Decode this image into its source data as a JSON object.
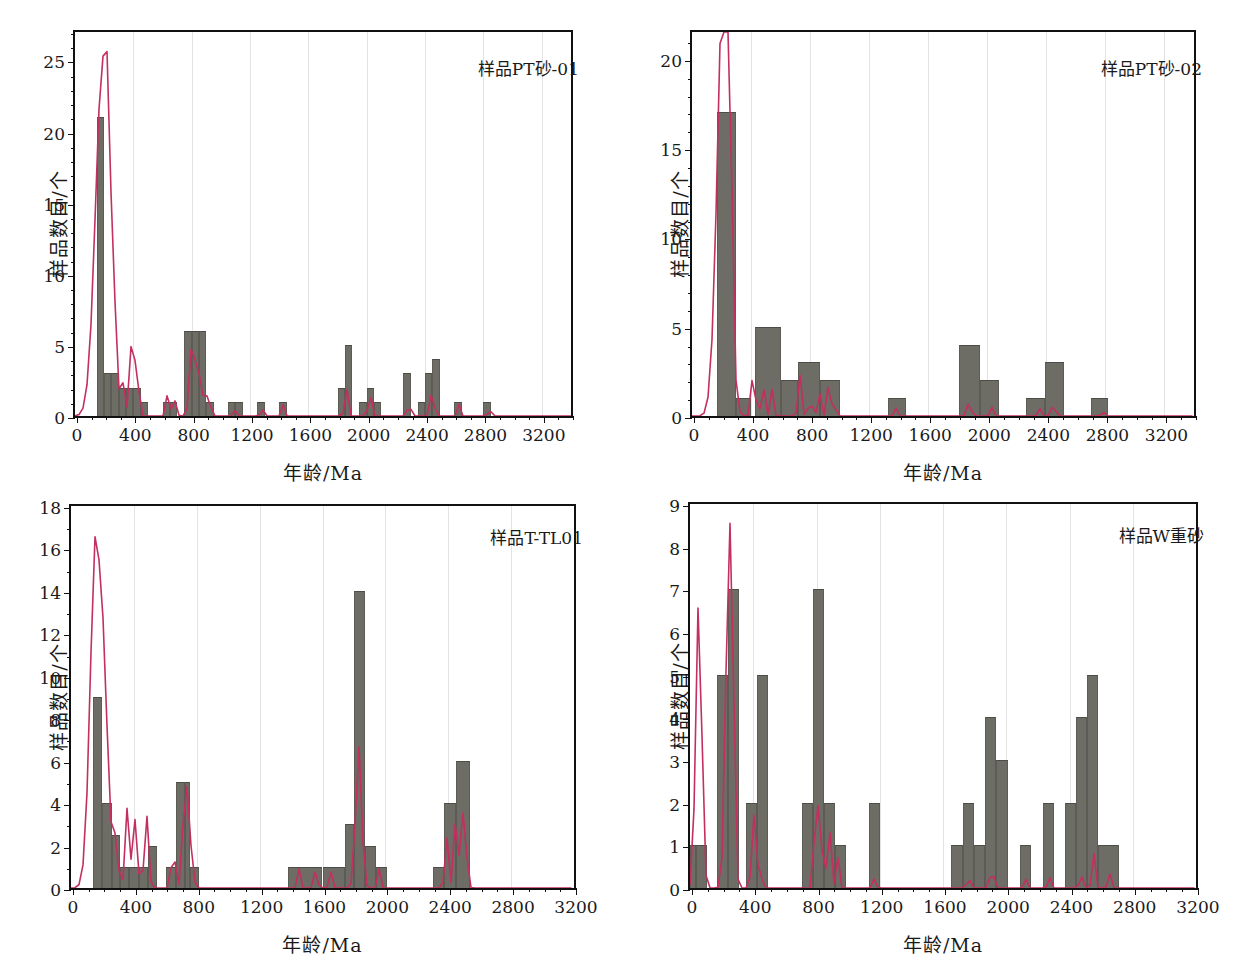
{
  "figure": {
    "panel_count": 4,
    "bar_color": "#6d6d66",
    "curve_color": "#c32f5e",
    "grid_color": "#e3e3e3",
    "axis_color": "#111111"
  },
  "common": {
    "xlabel": "年龄/Ma",
    "ylabel": "样品数目/个",
    "xticks": [
      0,
      400,
      800,
      1200,
      1600,
      2000,
      2400,
      2800,
      3200
    ],
    "xlim": [
      0,
      3400
    ]
  },
  "chart_data": [
    {
      "type": "bar",
      "id": "panel-a",
      "title": "样品PT砂-01",
      "xlabel": "年龄/Ma",
      "ylabel": "样品数目/个",
      "xlim": [
        0,
        3400
      ],
      "ylim": [
        0,
        27
      ],
      "yticks": [
        0,
        5,
        10,
        15,
        20,
        25
      ],
      "ytick_minor_step": 1,
      "grid": "vertical-only",
      "bin_width": 50,
      "bins": [
        {
          "x0": 150,
          "x1": 200,
          "value": 21
        },
        {
          "x0": 200,
          "x1": 250,
          "value": 3
        },
        {
          "x0": 250,
          "x1": 300,
          "value": 3
        },
        {
          "x0": 300,
          "x1": 350,
          "value": 2
        },
        {
          "x0": 350,
          "x1": 400,
          "value": 2
        },
        {
          "x0": 400,
          "x1": 450,
          "value": 2
        },
        {
          "x0": 450,
          "x1": 500,
          "value": 1
        },
        {
          "x0": 600,
          "x1": 650,
          "value": 1
        },
        {
          "x0": 650,
          "x1": 700,
          "value": 1
        },
        {
          "x0": 750,
          "x1": 800,
          "value": 6
        },
        {
          "x0": 800,
          "x1": 850,
          "value": 6
        },
        {
          "x0": 850,
          "x1": 900,
          "value": 6
        },
        {
          "x0": 900,
          "x1": 950,
          "value": 1
        },
        {
          "x0": 1050,
          "x1": 1100,
          "value": 1
        },
        {
          "x0": 1100,
          "x1": 1150,
          "value": 1
        },
        {
          "x0": 1250,
          "x1": 1300,
          "value": 1
        },
        {
          "x0": 1400,
          "x1": 1450,
          "value": 1
        },
        {
          "x0": 1800,
          "x1": 1850,
          "value": 2
        },
        {
          "x0": 1850,
          "x1": 1900,
          "value": 5
        },
        {
          "x0": 1950,
          "x1": 2000,
          "value": 1
        },
        {
          "x0": 2000,
          "x1": 2050,
          "value": 2
        },
        {
          "x0": 2050,
          "x1": 2100,
          "value": 1
        },
        {
          "x0": 2250,
          "x1": 2300,
          "value": 3
        },
        {
          "x0": 2350,
          "x1": 2400,
          "value": 1
        },
        {
          "x0": 2400,
          "x1": 2450,
          "value": 3
        },
        {
          "x0": 2450,
          "x1": 2500,
          "value": 4
        },
        {
          "x0": 2600,
          "x1": 2650,
          "value": 1
        },
        {
          "x0": 2800,
          "x1": 2850,
          "value": 1
        }
      ],
      "kde_peaks": [
        {
          "x": 190,
          "y": 24.7
        },
        {
          "x": 225,
          "y": 5.3
        },
        {
          "x": 265,
          "y": 3.1
        },
        {
          "x": 330,
          "y": 1.9
        },
        {
          "x": 395,
          "y": 6.0
        },
        {
          "x": 435,
          "y": 1.6
        },
        {
          "x": 640,
          "y": 2.1
        },
        {
          "x": 690,
          "y": 1.2
        },
        {
          "x": 800,
          "y": 4.9
        },
        {
          "x": 835,
          "y": 3.6
        },
        {
          "x": 865,
          "y": 2.6
        },
        {
          "x": 915,
          "y": 2.2
        },
        {
          "x": 1090,
          "y": 0.55
        },
        {
          "x": 1280,
          "y": 0.75
        },
        {
          "x": 1430,
          "y": 0.9
        },
        {
          "x": 1860,
          "y": 2.0
        },
        {
          "x": 2020,
          "y": 1.9
        },
        {
          "x": 2290,
          "y": 1.3
        },
        {
          "x": 2450,
          "y": 2.2
        },
        {
          "x": 2630,
          "y": 0.85
        },
        {
          "x": 2840,
          "y": 0.8
        }
      ]
    },
    {
      "type": "bar",
      "id": "panel-b",
      "title": "样品PT砂-02",
      "xlabel": "年龄/Ma",
      "ylabel": "样品数目/个",
      "xlim": [
        0,
        3400
      ],
      "ylim": [
        0,
        21.5
      ],
      "yticks": [
        0,
        5,
        10,
        15,
        20
      ],
      "ytick_minor_step": 1,
      "grid": "vertical-only",
      "bin_width": 100,
      "bins": [
        {
          "x0": 170,
          "x1": 300,
          "value": 17
        },
        {
          "x0": 300,
          "x1": 400,
          "value": 1
        },
        {
          "x0": 430,
          "x1": 600,
          "value": 5
        },
        {
          "x0": 600,
          "x1": 720,
          "value": 2
        },
        {
          "x0": 720,
          "x1": 870,
          "value": 3
        },
        {
          "x0": 870,
          "x1": 1000,
          "value": 2
        },
        {
          "x0": 1330,
          "x1": 1450,
          "value": 1
        },
        {
          "x0": 1810,
          "x1": 1950,
          "value": 4
        },
        {
          "x0": 1950,
          "x1": 2080,
          "value": 2
        },
        {
          "x0": 2260,
          "x1": 2390,
          "value": 1
        },
        {
          "x0": 2390,
          "x1": 2520,
          "value": 3
        },
        {
          "x0": 2700,
          "x1": 2820,
          "value": 1
        }
      ],
      "kde_peaks": [
        {
          "x": 205,
          "y": 19.4
        },
        {
          "x": 232,
          "y": 11.0
        },
        {
          "x": 255,
          "y": 6.2
        },
        {
          "x": 410,
          "y": 2.1
        },
        {
          "x": 445,
          "y": 1.5
        },
        {
          "x": 490,
          "y": 1.5
        },
        {
          "x": 540,
          "y": 1.5
        },
        {
          "x": 730,
          "y": 2.3
        },
        {
          "x": 800,
          "y": 1.4
        },
        {
          "x": 860,
          "y": 1.6
        },
        {
          "x": 920,
          "y": 1.6
        },
        {
          "x": 960,
          "y": 1.4
        },
        {
          "x": 1380,
          "y": 0.45
        },
        {
          "x": 1880,
          "y": 1.3
        },
        {
          "x": 2030,
          "y": 0.5
        },
        {
          "x": 2350,
          "y": 0.6
        },
        {
          "x": 2450,
          "y": 1.15
        },
        {
          "x": 2780,
          "y": 0.45
        }
      ]
    },
    {
      "type": "bar",
      "id": "panel-c",
      "title": "样品T-TL01",
      "xlabel": "年龄/Ma",
      "ylabel": "样品数目/个",
      "xlim": [
        0,
        3200
      ],
      "ylim": [
        0,
        18
      ],
      "yticks": [
        0,
        2,
        4,
        6,
        8,
        10,
        12,
        14,
        16,
        18
      ],
      "ytick_minor_step": 1,
      "grid": "vertical-only",
      "bin_width": 50,
      "bins": [
        {
          "x0": 140,
          "x1": 200,
          "value": 9
        },
        {
          "x0": 200,
          "x1": 260,
          "value": 4
        },
        {
          "x0": 260,
          "x1": 310,
          "value": 2.5
        },
        {
          "x0": 310,
          "x1": 370,
          "value": 1
        },
        {
          "x0": 370,
          "x1": 430,
          "value": 1
        },
        {
          "x0": 430,
          "x1": 490,
          "value": 1
        },
        {
          "x0": 490,
          "x1": 545,
          "value": 2
        },
        {
          "x0": 605,
          "x1": 665,
          "value": 1
        },
        {
          "x0": 665,
          "x1": 725,
          "value": 5
        },
        {
          "x0": 725,
          "x1": 760,
          "value": 5
        },
        {
          "x0": 760,
          "x1": 815,
          "value": 1
        },
        {
          "x0": 1380,
          "x1": 1600,
          "value": 1
        },
        {
          "x0": 1600,
          "x1": 1740,
          "value": 1
        },
        {
          "x0": 1740,
          "x1": 1800,
          "value": 3
        },
        {
          "x0": 1800,
          "x1": 1870,
          "value": 14
        },
        {
          "x0": 1870,
          "x1": 1940,
          "value": 2
        },
        {
          "x0": 1940,
          "x1": 2010,
          "value": 1
        },
        {
          "x0": 2300,
          "x1": 2370,
          "value": 1
        },
        {
          "x0": 2370,
          "x1": 2450,
          "value": 4
        },
        {
          "x0": 2450,
          "x1": 2540,
          "value": 6
        }
      ],
      "kde_peaks": [
        {
          "x": 160,
          "y": 16.9
        },
        {
          "x": 210,
          "y": 5.0
        },
        {
          "x": 235,
          "y": 3.0
        },
        {
          "x": 265,
          "y": 2.6
        },
        {
          "x": 290,
          "y": 2.2
        },
        {
          "x": 360,
          "y": 3.9
        },
        {
          "x": 410,
          "y": 3.3
        },
        {
          "x": 480,
          "y": 3.5
        },
        {
          "x": 650,
          "y": 2.2
        },
        {
          "x": 730,
          "y": 5.4
        },
        {
          "x": 770,
          "y": 1.7
        },
        {
          "x": 1450,
          "y": 0.9
        },
        {
          "x": 1560,
          "y": 1.1
        },
        {
          "x": 1650,
          "y": 0.85
        },
        {
          "x": 1830,
          "y": 6.7
        },
        {
          "x": 1960,
          "y": 0.9
        },
        {
          "x": 2390,
          "y": 2.4
        },
        {
          "x": 2450,
          "y": 3.5
        },
        {
          "x": 2500,
          "y": 3.9
        }
      ]
    },
    {
      "type": "bar",
      "id": "panel-d",
      "title": "样品W重砂",
      "xlabel": "年龄/Ma",
      "ylabel": "样品数目/个",
      "xlim": [
        0,
        3200
      ],
      "ylim": [
        0,
        9
      ],
      "yticks": [
        0,
        1,
        2,
        3,
        4,
        5,
        6,
        7,
        8,
        9
      ],
      "ytick_minor_step": 1,
      "grid": "vertical-only",
      "bin_width": 70,
      "bins": [
        {
          "x0": 0,
          "x1": 40,
          "value": 1
        },
        {
          "x0": 40,
          "x1": 105,
          "value": 1
        },
        {
          "x0": 170,
          "x1": 240,
          "value": 5
        },
        {
          "x0": 240,
          "x1": 310,
          "value": 7
        },
        {
          "x0": 355,
          "x1": 425,
          "value": 2
        },
        {
          "x0": 425,
          "x1": 495,
          "value": 5
        },
        {
          "x0": 710,
          "x1": 780,
          "value": 2
        },
        {
          "x0": 780,
          "x1": 850,
          "value": 7
        },
        {
          "x0": 850,
          "x1": 920,
          "value": 2
        },
        {
          "x0": 920,
          "x1": 985,
          "value": 1
        },
        {
          "x0": 1130,
          "x1": 1200,
          "value": 2
        },
        {
          "x0": 1650,
          "x1": 1725,
          "value": 1
        },
        {
          "x0": 1725,
          "x1": 1795,
          "value": 2
        },
        {
          "x0": 1795,
          "x1": 1865,
          "value": 1
        },
        {
          "x0": 1865,
          "x1": 1935,
          "value": 4
        },
        {
          "x0": 1935,
          "x1": 2010,
          "value": 3
        },
        {
          "x0": 2085,
          "x1": 2155,
          "value": 1
        },
        {
          "x0": 2230,
          "x1": 2300,
          "value": 2
        },
        {
          "x0": 2370,
          "x1": 2440,
          "value": 2
        },
        {
          "x0": 2440,
          "x1": 2510,
          "value": 4
        },
        {
          "x0": 2510,
          "x1": 2580,
          "value": 5
        },
        {
          "x0": 2580,
          "x1": 2710,
          "value": 1
        }
      ],
      "kde_peaks": [
        {
          "x": 55,
          "y": 6.75
        },
        {
          "x": 245,
          "y": 7.45
        },
        {
          "x": 262,
          "y": 2.3
        },
        {
          "x": 280,
          "y": 1.8
        },
        {
          "x": 400,
          "y": 1.9
        },
        {
          "x": 440,
          "y": 1.0
        },
        {
          "x": 800,
          "y": 2.7
        },
        {
          "x": 845,
          "y": 1.5
        },
        {
          "x": 885,
          "y": 1.3
        },
        {
          "x": 930,
          "y": 0.9
        },
        {
          "x": 1170,
          "y": 0.3
        },
        {
          "x": 1760,
          "y": 0.45
        },
        {
          "x": 1910,
          "y": 0.8
        },
        {
          "x": 2120,
          "y": 0.25
        },
        {
          "x": 2270,
          "y": 0.35
        },
        {
          "x": 2470,
          "y": 0.5
        },
        {
          "x": 2550,
          "y": 0.95
        },
        {
          "x": 2650,
          "y": 0.45
        }
      ]
    }
  ]
}
